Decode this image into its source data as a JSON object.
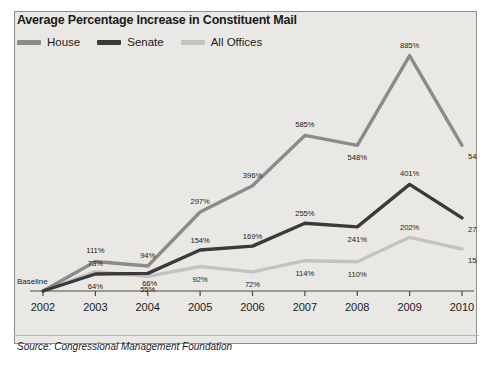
{
  "panel": {
    "title": "Average Percentage Increase in Constituent Mail",
    "source": "Source:  Congressional Management Foundation",
    "baseline_label": "Baseline"
  },
  "legend": {
    "items": [
      {
        "label": "House",
        "color": "#8b8b8b"
      },
      {
        "label": "Senate",
        "color": "#3a3a3a"
      },
      {
        "label": "All Offices",
        "color": "#c2c2c2"
      }
    ]
  },
  "colors": {
    "panel_bg": "#e9e8e4",
    "panel_border": "#8d8d8a",
    "axis": "#4a4a4a",
    "text": "#1b1b1b",
    "house": "#8b8b8b",
    "senate": "#3a3a3a",
    "all_offices": "#c2c2c2"
  },
  "chart_data": {
    "type": "line",
    "title": "Average Percentage Increase in Constituent Mail",
    "xlabel": "",
    "ylabel": "",
    "grid": false,
    "legend_position": "top-left",
    "categories": [
      "2002",
      "2003",
      "2004",
      "2005",
      "2006",
      "2007",
      "2008",
      "2009",
      "2010"
    ],
    "ylim": [
      0,
      940
    ],
    "baseline_note": "Baseline",
    "series": [
      {
        "name": "House",
        "color": "#8b8b8b",
        "values": [
          0,
          111,
          94,
          297,
          396,
          585,
          548,
          885,
          548
        ],
        "labels": [
          "Baseline",
          "111%",
          "94%",
          "297%",
          "396%",
          "585%",
          "548%",
          "885%",
          "548%"
        ]
      },
      {
        "name": "Senate",
        "color": "#3a3a3a",
        "values": [
          0,
          64,
          66,
          154,
          169,
          255,
          241,
          401,
          275
        ],
        "labels": [
          "Baseline",
          "64%",
          "66%",
          "154%",
          "169%",
          "255%",
          "241%",
          "401%",
          "275%"
        ]
      },
      {
        "name": "All Offices",
        "color": "#c2c2c2",
        "values": [
          0,
          73,
          55,
          92,
          72,
          114,
          110,
          202,
          158
        ],
        "labels": [
          "Baseline",
          "73%",
          "55%",
          "92%",
          "72%",
          "114%",
          "110%",
          "202%",
          "158%"
        ]
      }
    ]
  }
}
